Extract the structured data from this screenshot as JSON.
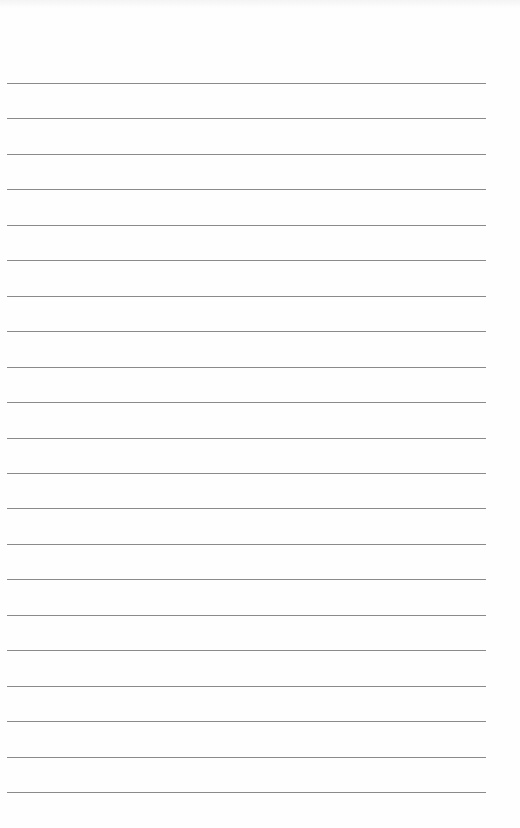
{
  "page": {
    "type": "lined-notebook-page",
    "background_color": "#fefefe",
    "rule_color": "#8a8a8a",
    "rule_count": 21,
    "first_rule_y": 83,
    "rule_spacing": 35.45,
    "rule_left_x": 7,
    "rule_right_x": 486,
    "text_content": []
  }
}
